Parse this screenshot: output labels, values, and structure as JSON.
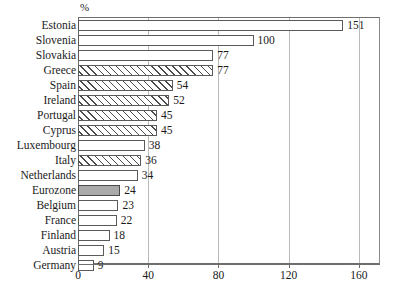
{
  "chart_data": {
    "type": "bar",
    "orientation": "horizontal",
    "title": "",
    "subtitle": "",
    "unit_label": "%",
    "xlabel": "",
    "ylabel": "",
    "xlim": [
      0,
      172
    ],
    "xticks": [
      0,
      40,
      80,
      120,
      160
    ],
    "xtick_labels": [
      "0",
      "40",
      "80",
      "120",
      "160"
    ],
    "grid": "vertical",
    "legend": "none",
    "categories": [
      "Estonia",
      "Slovenia",
      "Slovakia",
      "Greece",
      "Spain",
      "Ireland",
      "Portugal",
      "Cyprus",
      "Luxembourg",
      "Italy",
      "Netherlands",
      "Eurozone",
      "Belgium",
      "France",
      "Finland",
      "Austria",
      "Germany"
    ],
    "values": [
      151,
      100,
      77,
      77,
      54,
      52,
      45,
      45,
      38,
      36,
      34,
      24,
      23,
      22,
      18,
      15,
      9
    ],
    "value_labels": [
      "151",
      "100",
      "77",
      "77",
      "54",
      "52",
      "45",
      "45",
      "38",
      "36",
      "34",
      "24",
      "23",
      "22",
      "18",
      "15",
      "9"
    ],
    "styles": [
      "plain",
      "plain",
      "plain",
      "hatched",
      "hatched",
      "hatched",
      "hatched",
      "hatched",
      "plain",
      "hatched",
      "plain",
      "solid-gray",
      "plain",
      "plain",
      "plain",
      "plain",
      "plain"
    ],
    "colors": {
      "bar_fill": "#ffffff",
      "bar_border": "#5a5a5a",
      "hatch": "#4a4a4a",
      "highlight_fill": "#a9a9a9",
      "grid": "#b9b9b9",
      "axis": "#6e6e6e",
      "text": "#1a1a1a"
    }
  }
}
